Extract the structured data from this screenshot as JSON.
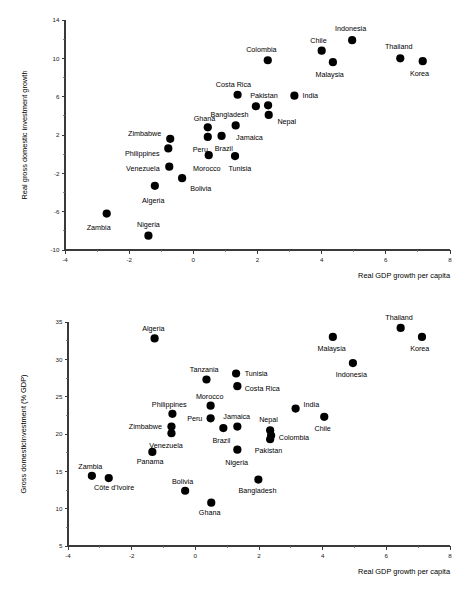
{
  "figure": {
    "panels": [
      {
        "name": "top-panel",
        "xlabel": "Real GDP growth per capita",
        "ylabel": "Real gross domestic investment growth"
      },
      {
        "name": "bottom-panel",
        "xlabel": "Real GDP growth per capita",
        "ylabel": "Gross domesticInvestment (% GDP)"
      }
    ]
  },
  "chart_data": [
    {
      "type": "scatter",
      "title": "",
      "xlabel": "Real GDP growth per capita",
      "ylabel": "Real gross domestic investment growth",
      "xlim": [
        -4,
        8
      ],
      "ylim": [
        -10,
        14
      ],
      "xticks": [
        -4,
        -2,
        0,
        2,
        4,
        6,
        8
      ],
      "yticks": [
        -10,
        -6,
        -2,
        2,
        6,
        10,
        14
      ],
      "xticklabels": [
        "-4",
        "-2",
        "0",
        "2",
        "4",
        "6",
        "8"
      ],
      "yticklabels": [
        "-10",
        "-6",
        "-2",
        "2",
        "6",
        "10",
        "14"
      ],
      "grid": false,
      "legend": "none",
      "points": [
        {
          "label": "Zambia",
          "x": -2.7,
          "y": -6.2,
          "lx": -2.95,
          "ly": -7.6,
          "anchor": "middle"
        },
        {
          "label": "Nigeria",
          "x": -1.4,
          "y": -8.5,
          "lx": -1.4,
          "ly": -7.3,
          "anchor": "middle"
        },
        {
          "label": "Algeria",
          "x": -1.2,
          "y": -3.3,
          "lx": -1.25,
          "ly": -4.8,
          "anchor": "middle"
        },
        {
          "label": "Bolivia",
          "x": -0.35,
          "y": -2.5,
          "lx": -0.1,
          "ly": -3.6,
          "anchor": "start"
        },
        {
          "label": "Venezuela",
          "x": -0.75,
          "y": -1.3,
          "lx": -1.05,
          "ly": -1.5,
          "anchor": "end"
        },
        {
          "label": "Philippines",
          "x": -0.78,
          "y": 0.6,
          "lx": -1.05,
          "ly": 0.1,
          "anchor": "end"
        },
        {
          "label": "Zimbabwe",
          "x": -0.72,
          "y": 1.6,
          "lx": -1.0,
          "ly": 2.2,
          "anchor": "end"
        },
        {
          "label": "Morocco",
          "x": 0.48,
          "y": -0.1,
          "lx": 0.42,
          "ly": -1.5,
          "anchor": "middle"
        },
        {
          "label": "Peru",
          "x": 0.45,
          "y": 1.8,
          "lx": 0.22,
          "ly": 0.5,
          "anchor": "middle"
        },
        {
          "label": "Ghana",
          "x": 0.45,
          "y": 2.8,
          "lx": 0.35,
          "ly": 3.7,
          "anchor": "middle"
        },
        {
          "label": "Brazil",
          "x": 0.88,
          "y": 1.9,
          "lx": 0.95,
          "ly": 0.6,
          "anchor": "middle"
        },
        {
          "label": "Tunisia",
          "x": 1.3,
          "y": -0.2,
          "lx": 1.45,
          "ly": -1.5,
          "anchor": "middle"
        },
        {
          "label": "Jamaica",
          "x": 1.32,
          "y": 3.0,
          "lx": 1.75,
          "ly": 1.8,
          "anchor": "middle"
        },
        {
          "label": "Costa Rica",
          "x": 1.38,
          "y": 6.2,
          "lx": 1.25,
          "ly": 7.3,
          "anchor": "middle"
        },
        {
          "label": "Bangladesh",
          "x": 1.95,
          "y": 5.0,
          "lx": 1.72,
          "ly": 4.2,
          "anchor": "end"
        },
        {
          "label": "Pakistan",
          "x": 2.33,
          "y": 5.1,
          "lx": 2.2,
          "ly": 6.1,
          "anchor": "middle"
        },
        {
          "label": "Nepal",
          "x": 2.35,
          "y": 4.1,
          "lx": 2.62,
          "ly": 3.4,
          "anchor": "start"
        },
        {
          "label": "Colombia",
          "x": 2.32,
          "y": 9.8,
          "lx": 2.12,
          "ly": 10.9,
          "anchor": "middle"
        },
        {
          "label": "India",
          "x": 3.15,
          "y": 6.1,
          "lx": 3.4,
          "ly": 6.1,
          "anchor": "start"
        },
        {
          "label": "Chile",
          "x": 4.0,
          "y": 10.8,
          "lx": 3.9,
          "ly": 11.9,
          "anchor": "middle"
        },
        {
          "label": "Malaysia",
          "x": 4.35,
          "y": 9.6,
          "lx": 4.25,
          "ly": 8.3,
          "anchor": "middle"
        },
        {
          "label": "Indonesia",
          "x": 4.95,
          "y": 11.9,
          "lx": 4.9,
          "ly": 13.1,
          "anchor": "middle"
        },
        {
          "label": "Thailand",
          "x": 6.45,
          "y": 10.0,
          "lx": 6.4,
          "ly": 11.2,
          "anchor": "middle"
        },
        {
          "label": "Korea",
          "x": 7.15,
          "y": 9.7,
          "lx": 7.05,
          "ly": 8.4,
          "anchor": "middle"
        }
      ]
    },
    {
      "type": "scatter",
      "title": "",
      "xlabel": "Real GDP growth per capita",
      "ylabel": "Gross domesticInvestment (% GDP)",
      "xlim": [
        -4,
        8
      ],
      "ylim": [
        5,
        35
      ],
      "xticks": [
        -4,
        -2,
        0,
        2,
        4,
        6,
        8
      ],
      "yticks": [
        5,
        10,
        15,
        20,
        25,
        30,
        35
      ],
      "xticklabels": [
        "-4",
        "-2",
        "0",
        "2",
        "4",
        "6",
        "8"
      ],
      "yticklabels": [
        "5",
        "10",
        "15",
        "20",
        "25",
        "30",
        "35"
      ],
      "grid": false,
      "legend": "none",
      "points": [
        {
          "label": "Zambia",
          "x": -3.25,
          "y": 14.4,
          "lx": -3.3,
          "ly": 15.6,
          "anchor": "middle"
        },
        {
          "label": "Côte d'Ivoire",
          "x": -2.72,
          "y": 14.1,
          "lx": -2.55,
          "ly": 12.9,
          "anchor": "middle"
        },
        {
          "label": "Panama",
          "x": -1.35,
          "y": 17.6,
          "lx": -1.42,
          "ly": 16.3,
          "anchor": "middle"
        },
        {
          "label": "Algeria",
          "x": -1.28,
          "y": 32.8,
          "lx": -1.32,
          "ly": 34.2,
          "anchor": "middle"
        },
        {
          "label": "Zimbabwe",
          "x": -0.75,
          "y": 21.0,
          "lx": -1.05,
          "ly": 21.0,
          "anchor": "end"
        },
        {
          "label": "Venezuela",
          "x": -0.75,
          "y": 20.1,
          "lx": -0.92,
          "ly": 18.5,
          "anchor": "middle"
        },
        {
          "label": "Philippines",
          "x": -0.72,
          "y": 22.7,
          "lx": -0.82,
          "ly": 24.0,
          "anchor": "middle"
        },
        {
          "label": "Bolivia",
          "x": -0.32,
          "y": 12.4,
          "lx": -0.4,
          "ly": 13.7,
          "anchor": "middle"
        },
        {
          "label": "Tanzania",
          "x": 0.35,
          "y": 27.3,
          "lx": 0.28,
          "ly": 28.6,
          "anchor": "middle"
        },
        {
          "label": "Morocco",
          "x": 0.48,
          "y": 23.8,
          "lx": 0.45,
          "ly": 25.1,
          "anchor": "middle"
        },
        {
          "label": "Peru",
          "x": 0.48,
          "y": 22.1,
          "lx": 0.22,
          "ly": 22.1,
          "anchor": "end"
        },
        {
          "label": "Ghana",
          "x": 0.5,
          "y": 10.8,
          "lx": 0.45,
          "ly": 9.5,
          "anchor": "middle"
        },
        {
          "label": "Brazil",
          "x": 0.88,
          "y": 20.8,
          "lx": 0.82,
          "ly": 19.2,
          "anchor": "middle"
        },
        {
          "label": "Jamaica",
          "x": 1.32,
          "y": 21.0,
          "lx": 1.3,
          "ly": 22.4,
          "anchor": "middle"
        },
        {
          "label": "Tunisia",
          "x": 1.28,
          "y": 28.1,
          "lx": 1.55,
          "ly": 28.1,
          "anchor": "start"
        },
        {
          "label": "Costa Rica",
          "x": 1.32,
          "y": 26.4,
          "lx": 1.55,
          "ly": 26.1,
          "anchor": "start"
        },
        {
          "label": "Nigeria",
          "x": 1.32,
          "y": 17.9,
          "lx": 1.3,
          "ly": 16.2,
          "anchor": "middle"
        },
        {
          "label": "Bangladesh",
          "x": 1.98,
          "y": 13.9,
          "lx": 1.95,
          "ly": 12.4,
          "anchor": "middle"
        },
        {
          "label": "Nepal",
          "x": 2.35,
          "y": 20.5,
          "lx": 2.3,
          "ly": 22.0,
          "anchor": "middle"
        },
        {
          "label": "Colombia",
          "x": 2.38,
          "y": 19.8,
          "lx": 2.62,
          "ly": 19.6,
          "anchor": "start"
        },
        {
          "label": "Pakistan",
          "x": 2.35,
          "y": 19.3,
          "lx": 2.3,
          "ly": 17.8,
          "anchor": "middle"
        },
        {
          "label": "India",
          "x": 3.15,
          "y": 23.4,
          "lx": 3.4,
          "ly": 23.9,
          "anchor": "start"
        },
        {
          "label": "Chile",
          "x": 4.05,
          "y": 22.3,
          "lx": 4.0,
          "ly": 20.8,
          "anchor": "middle"
        },
        {
          "label": "Malaysia",
          "x": 4.32,
          "y": 33.0,
          "lx": 4.28,
          "ly": 31.5,
          "anchor": "middle"
        },
        {
          "label": "Indonesia",
          "x": 4.95,
          "y": 29.5,
          "lx": 4.9,
          "ly": 28.0,
          "anchor": "middle"
        },
        {
          "label": "Thailand",
          "x": 6.45,
          "y": 34.2,
          "lx": 6.4,
          "ly": 35.6,
          "anchor": "middle"
        },
        {
          "label": "Korea",
          "x": 7.12,
          "y": 33.0,
          "lx": 7.05,
          "ly": 31.5,
          "anchor": "middle"
        }
      ]
    }
  ]
}
